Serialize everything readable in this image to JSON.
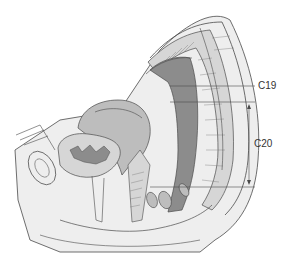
{
  "figure": {
    "type": "anatomical sagittal section",
    "labels": [
      {
        "id": "C19",
        "text": "C19"
      },
      {
        "id": "C20",
        "text": "C20"
      }
    ],
    "colors": {
      "outline": "#4a4a4a",
      "tissue_light": "#eeeeee",
      "tissue_mid": "#d6d6d6",
      "organ_dark": "#8c8c8c",
      "organ_mid": "#bdbdbd",
      "background": "#ffffff"
    }
  }
}
